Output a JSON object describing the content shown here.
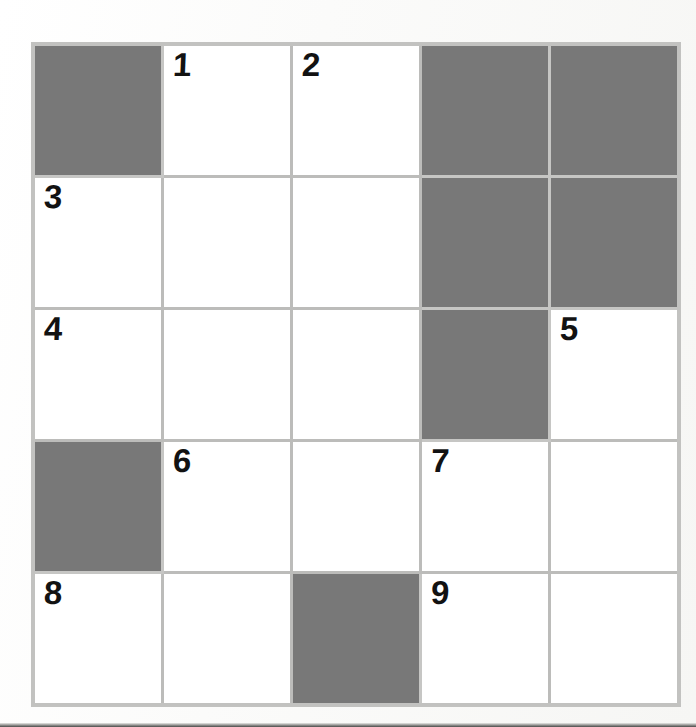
{
  "puzzle": {
    "type": "crossword-grid",
    "title": "Crossword Puzzle Grid",
    "rows": 5,
    "columns": 5,
    "colors": {
      "shaded_cell": "#787878",
      "open_cell": "#ffffff",
      "grid_line": "#bcbcba",
      "outer_border": "#c2c2c0",
      "number_text": "#121212",
      "page_background": "#fbfbfa"
    },
    "clue_numbers_present": [
      "1",
      "2",
      "3",
      "4",
      "5",
      "6",
      "7",
      "8",
      "9"
    ],
    "grid": [
      [
        {
          "shaded": true,
          "number": ""
        },
        {
          "shaded": false,
          "number": "1"
        },
        {
          "shaded": false,
          "number": "2"
        },
        {
          "shaded": true,
          "number": ""
        },
        {
          "shaded": true,
          "number": ""
        }
      ],
      [
        {
          "shaded": false,
          "number": "3"
        },
        {
          "shaded": false,
          "number": ""
        },
        {
          "shaded": false,
          "number": ""
        },
        {
          "shaded": true,
          "number": ""
        },
        {
          "shaded": true,
          "number": ""
        }
      ],
      [
        {
          "shaded": false,
          "number": "4"
        },
        {
          "shaded": false,
          "number": ""
        },
        {
          "shaded": false,
          "number": ""
        },
        {
          "shaded": true,
          "number": ""
        },
        {
          "shaded": false,
          "number": "5"
        }
      ],
      [
        {
          "shaded": true,
          "number": ""
        },
        {
          "shaded": false,
          "number": "6"
        },
        {
          "shaded": false,
          "number": ""
        },
        {
          "shaded": false,
          "number": "7"
        },
        {
          "shaded": false,
          "number": ""
        }
      ],
      [
        {
          "shaded": false,
          "number": "8"
        },
        {
          "shaded": false,
          "number": ""
        },
        {
          "shaded": true,
          "number": ""
        },
        {
          "shaded": false,
          "number": "9"
        },
        {
          "shaded": false,
          "number": ""
        }
      ]
    ]
  }
}
